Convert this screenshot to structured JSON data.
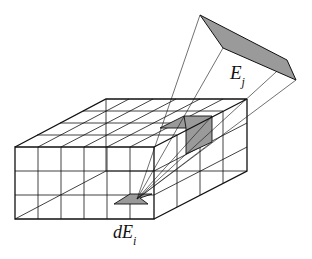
{
  "diagram": {
    "type": "radiosity form factor illustration",
    "labels": {
      "source_patch": "E",
      "source_sub": "j",
      "receiver_patch": "dE",
      "receiver_sub": "i"
    },
    "colors": {
      "stroke": "#111111",
      "patch_fill": "#9a9a9a",
      "background": "#ffffff"
    }
  }
}
